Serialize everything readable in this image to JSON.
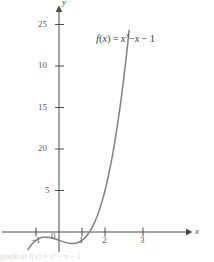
{
  "figure": {
    "background_color": "#ffffff",
    "curve_color": "#808080",
    "axis_color": "#4a4a4a",
    "text_color": "#5a5a5a",
    "caption_faint": "graph of f(x) = x³ − x − 1"
  },
  "function_label": {
    "fn_name": "f",
    "open_paren": "(",
    "var1": "x",
    "close_paren": ")",
    "equals": "=",
    "var2": "x",
    "exponent": "3",
    "minus1": "−",
    "var3": "x",
    "minus2": "−",
    "const": "1"
  },
  "axes": {
    "x_axis_name": "x",
    "y_axis_name": "y",
    "x_ticks": [
      {
        "label": "−1",
        "value": -1
      },
      {
        "label": "0",
        "value": 0
      },
      {
        "label": "1",
        "value": 1
      },
      {
        "label": "2",
        "value": 2
      },
      {
        "label": "3",
        "value": 3
      }
    ],
    "y_ticks": [
      {
        "label": "5",
        "value": 5
      },
      {
        "label": "10",
        "value": 10
      },
      {
        "label": "15",
        "value": 15
      },
      {
        "label": "20",
        "value": 20
      },
      {
        "label": "25",
        "value": 25
      }
    ]
  },
  "chart_data": {
    "type": "line",
    "title": "",
    "subtitle": "",
    "xlabel": "x",
    "ylabel": "y",
    "xlim": [
      -1.35,
      3.3
    ],
    "ylim": [
      -3.5,
      27.5
    ],
    "grid": false,
    "legend": null,
    "annotations": [
      {
        "text": "f(x) = x³ − x − 1",
        "x": 1.55,
        "y": 23.2
      }
    ],
    "xticks": [
      -1,
      0,
      1,
      2,
      3
    ],
    "yticks": [
      5,
      10,
      15,
      20,
      25
    ],
    "series": [
      {
        "name": "f(x) = x^3 - x - 1",
        "expression": "x**3 - x - 1",
        "color": "#808080",
        "x": [
          -1.35,
          -1.2,
          -1.1,
          -1.0,
          -0.9,
          -0.8,
          -0.7,
          -0.6,
          -0.5,
          -0.4,
          -0.3,
          -0.2,
          -0.1,
          0.0,
          0.1,
          0.2,
          0.3,
          0.4,
          0.5,
          0.6,
          0.7,
          0.8,
          0.9,
          1.0,
          1.1,
          1.2,
          1.3,
          1.4,
          1.5,
          1.6,
          1.7,
          1.8,
          1.9,
          2.0,
          2.1,
          2.2,
          2.3,
          2.4,
          2.5,
          2.6,
          2.7,
          2.8,
          2.9,
          3.0,
          3.05
        ],
        "y": [
          -2.11,
          -1.53,
          -1.23,
          -1.0,
          -0.83,
          -0.71,
          -0.64,
          -0.62,
          -0.63,
          -0.66,
          -0.73,
          -0.81,
          -0.9,
          -1.0,
          -1.1,
          -1.19,
          -1.27,
          -1.34,
          -1.38,
          -1.38,
          -1.36,
          -1.29,
          -1.17,
          -1.0,
          -0.77,
          -0.47,
          -0.1,
          0.34,
          0.88,
          1.5,
          2.21,
          3.03,
          3.96,
          5.0,
          6.16,
          7.45,
          8.87,
          10.42,
          12.13,
          13.98,
          15.98,
          18.15,
          20.49,
          23.0,
          24.31
        ]
      }
    ],
    "features": {
      "local_max": {
        "x": -0.577,
        "y": -0.615
      },
      "local_min": {
        "x": 0.577,
        "y": -1.385
      },
      "real_root": {
        "x": 1.3247,
        "y": 0
      }
    }
  }
}
